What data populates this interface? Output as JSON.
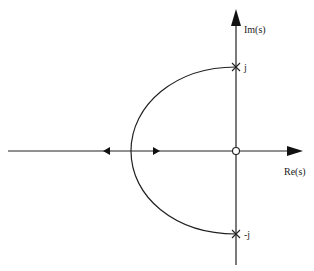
{
  "diagram": {
    "type": "root-locus",
    "axes": {
      "imag_label": "Im(s)",
      "real_label": "Re(s)"
    },
    "poles": [
      {
        "label": "j",
        "re": 0,
        "im": 1
      },
      {
        "label": "-j",
        "re": 0,
        "im": -1
      }
    ],
    "zeros": [
      {
        "re": 0,
        "im": 0
      }
    ],
    "locus": {
      "branch": "semicircle from j to -j through left half-plane, breaking into real axis",
      "real_axis_segment": "negative real axis, with arrows pointing left and right from break-in point"
    },
    "colors": {
      "line": "#222222",
      "background": "#ffffff"
    }
  }
}
